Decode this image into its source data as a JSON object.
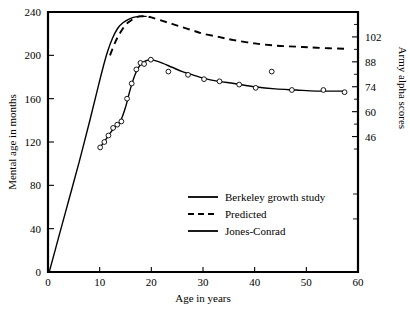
{
  "chart_data": {
    "type": "line",
    "title": "",
    "xlabel": "Age in years",
    "ylabel": "Mental age in months",
    "ylabel_right": "Army alpha scores",
    "xlim": [
      0,
      60
    ],
    "ylim": [
      0,
      240
    ],
    "ylim_right": [
      0,
      240
    ],
    "grid": false,
    "legend_position": "center-bottom-inside",
    "xticks": [
      0,
      10,
      20,
      30,
      40,
      50,
      60
    ],
    "xtick_labels": [
      "0",
      "10",
      "20",
      "30",
      "40",
      "50",
      "60"
    ],
    "yticks": [
      0,
      40,
      80,
      120,
      160,
      200,
      240
    ],
    "ytick_labels": [
      "0",
      "40",
      "80",
      "120",
      "160",
      "200",
      "240"
    ],
    "yticks_right_values": [
      46,
      60,
      74,
      88,
      102
    ],
    "yticks_right_labels": [
      "46",
      "60",
      "74",
      "88",
      "102"
    ],
    "yticks_right_at_mental_age": [
      125,
      148,
      171,
      194,
      217
    ],
    "series": [
      {
        "name": "Berkeley growth study",
        "style": "solid",
        "markers": "open-circle",
        "points": [
          [
            10.1,
            115
          ],
          [
            10.9,
            120
          ],
          [
            11.7,
            126
          ],
          [
            12.6,
            133
          ],
          [
            13.4,
            136
          ],
          [
            14.2,
            139
          ],
          [
            15.3,
            160
          ],
          [
            16.2,
            174
          ],
          [
            17.1,
            187
          ],
          [
            17.9,
            193
          ],
          [
            18.6,
            192
          ],
          [
            19.9,
            196
          ],
          [
            23.3,
            185
          ],
          [
            27.1,
            182
          ],
          [
            30.2,
            178
          ],
          [
            33.2,
            176
          ],
          [
            37.0,
            173
          ],
          [
            40.2,
            170
          ],
          [
            43.3,
            185
          ],
          [
            47.2,
            168
          ],
          [
            53.3,
            168
          ],
          [
            57.4,
            166
          ]
        ],
        "fit_curve": [
          [
            10.1,
            115
          ],
          [
            11.0,
            121
          ],
          [
            12.0,
            128
          ],
          [
            13.0,
            134
          ],
          [
            14.0,
            139
          ],
          [
            15.0,
            152
          ],
          [
            16.0,
            170
          ],
          [
            17.0,
            184
          ],
          [
            18.0,
            192
          ],
          [
            19.0,
            195
          ],
          [
            20.0,
            196
          ],
          [
            22.0,
            193
          ],
          [
            24.0,
            189
          ],
          [
            26.0,
            185
          ],
          [
            28.0,
            182
          ],
          [
            30.0,
            179
          ],
          [
            33.0,
            176
          ],
          [
            36.0,
            174
          ],
          [
            40.0,
            171
          ],
          [
            44.0,
            169
          ],
          [
            48.0,
            168
          ],
          [
            52.0,
            167
          ],
          [
            57.4,
            167
          ]
        ]
      },
      {
        "name": "Predicted",
        "style": "dashed",
        "markers": "none",
        "points": [
          [
            12.0,
            200
          ],
          [
            13.0,
            212
          ],
          [
            14.0,
            221
          ],
          [
            15.0,
            228
          ],
          [
            16.0,
            232
          ],
          [
            17.0,
            235
          ],
          [
            18.0,
            236
          ],
          [
            19.0,
            236
          ],
          [
            20.0,
            235
          ],
          [
            22.0,
            232
          ],
          [
            24.0,
            229
          ],
          [
            26.0,
            226
          ],
          [
            28.0,
            223
          ],
          [
            30.0,
            220
          ],
          [
            33.0,
            217
          ],
          [
            36.0,
            214
          ],
          [
            40.0,
            211
          ],
          [
            44.0,
            209
          ],
          [
            48.0,
            208
          ],
          [
            52.0,
            207
          ],
          [
            57.4,
            206
          ]
        ]
      },
      {
        "name": "Jones-Conrad",
        "style": "solid",
        "markers": "none",
        "points": [
          [
            0.3,
            1
          ],
          [
            2.0,
            31
          ],
          [
            4.0,
            66
          ],
          [
            6.0,
            101
          ],
          [
            8.0,
            138
          ],
          [
            9.5,
            167
          ],
          [
            10.5,
            186
          ],
          [
            11.5,
            203
          ],
          [
            12.5,
            216
          ],
          [
            13.5,
            225
          ],
          [
            14.5,
            230
          ],
          [
            15.5,
            233
          ],
          [
            16.5,
            235
          ],
          [
            17.5,
            236
          ],
          [
            18.5,
            236
          ],
          [
            19.0,
            236
          ]
        ]
      }
    ],
    "legend": [
      {
        "label": "Berkeley growth study",
        "style": "solid"
      },
      {
        "label": "Predicted",
        "style": "dashed"
      },
      {
        "label": "Jones-Conrad",
        "style": "solid"
      }
    ]
  }
}
